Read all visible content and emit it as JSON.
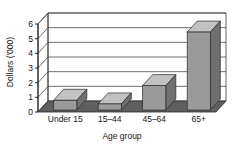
{
  "chart_data": {
    "type": "bar",
    "title": "",
    "subtitle": "",
    "xlabel": "Age group",
    "ylabel": "Dollars ('000)",
    "categories": [
      "Under 15",
      "15–44",
      "45–64",
      "65+"
    ],
    "values": [
      0.8,
      0.55,
      1.8,
      5.45
    ],
    "series": [
      {
        "name": "Dollars ('000)",
        "values": [
          0.8,
          0.55,
          1.8,
          5.45
        ]
      }
    ],
    "ylim": [
      0,
      6
    ],
    "yticks": [
      "0",
      "1",
      "2",
      "3",
      "4",
      "5",
      "6"
    ],
    "ytick_values": [
      0,
      1,
      2,
      3,
      4,
      5,
      6
    ],
    "grid": true,
    "legend": "none",
    "style": "3d-column",
    "colors": {
      "bar_front": "#9a9a9a",
      "bar_top": "#c2c2c2",
      "bar_side": "#6f6f6f",
      "floor": "#5f5f5f",
      "wall": "#ffffff",
      "grid_line": "#4a4a4a",
      "axis_line": "#222222",
      "background": "#ffffff",
      "text": "#151515"
    }
  },
  "axes": {
    "y": {
      "label": "Dollars ('000)",
      "ticks": [
        "0",
        "1",
        "2",
        "3",
        "4",
        "5",
        "6"
      ]
    },
    "x": {
      "label": "Age group",
      "ticks": [
        "Under 15",
        "15–44",
        "45–64",
        "65+"
      ]
    }
  }
}
